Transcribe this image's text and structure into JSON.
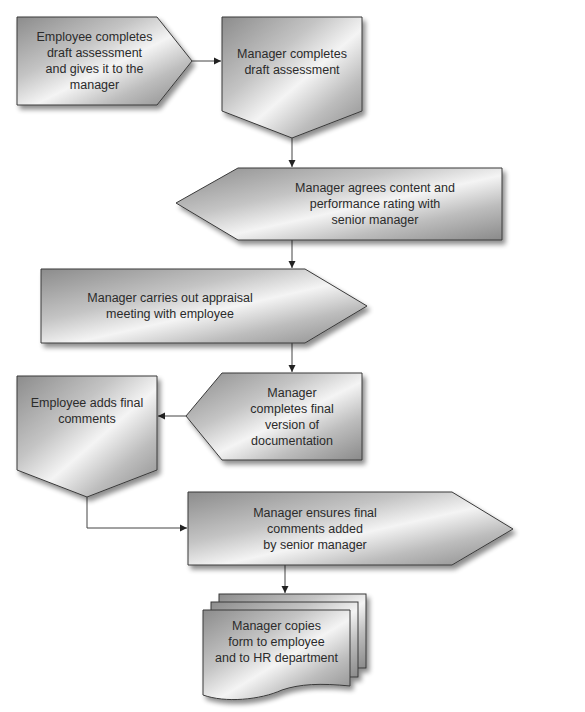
{
  "diagram": {
    "type": "flowchart",
    "title": "",
    "colors": {
      "shape_fill_dark": "#8e8e8e",
      "shape_fill_light": "#f2f2f2",
      "shape_stroke": "#3a3a3a",
      "connector": "#444444",
      "text": "#2b2b2b"
    },
    "nodes": [
      {
        "id": "n1",
        "label": "Employee completes\ndraft assessment\nand gives it to the\nmanager",
        "shape": "pentagon-right"
      },
      {
        "id": "n2",
        "label": "Manager completes\ndraft assessment",
        "shape": "pentagon-down"
      },
      {
        "id": "n3",
        "label": "Manager agrees content and\nperformance rating with\nsenior manager",
        "shape": "pentagon-left"
      },
      {
        "id": "n4",
        "label": "Manager carries out appraisal\nmeeting with employee",
        "shape": "pentagon-right"
      },
      {
        "id": "n5",
        "label": "Manager\ncompletes final\nversion of\ndocumentation",
        "shape": "pentagon-left"
      },
      {
        "id": "n6",
        "label": "Employee adds final\ncomments",
        "shape": "pentagon-down"
      },
      {
        "id": "n7",
        "label": "Manager ensures final\ncomments added\nby senior manager",
        "shape": "pentagon-right"
      },
      {
        "id": "n8",
        "label": "Manager copies\nform to employee\nand to HR department",
        "shape": "multi-document"
      }
    ],
    "edges": [
      {
        "from": "n1",
        "to": "n2"
      },
      {
        "from": "n2",
        "to": "n3"
      },
      {
        "from": "n3",
        "to": "n4"
      },
      {
        "from": "n4",
        "to": "n5"
      },
      {
        "from": "n5",
        "to": "n6"
      },
      {
        "from": "n6",
        "to": "n7"
      },
      {
        "from": "n7",
        "to": "n8"
      }
    ]
  }
}
